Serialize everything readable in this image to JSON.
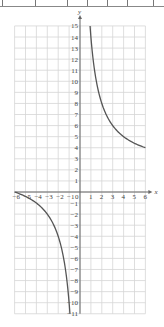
{
  "top_strip": {
    "dividers_x": [
      2,
      35,
      67,
      87,
      107,
      127,
      153
    ]
  },
  "chart_data": {
    "type": "line",
    "title": "",
    "xlabel": "x",
    "ylabel": "y",
    "xlim": [
      -6,
      6
    ],
    "ylim": [
      -11,
      15
    ],
    "grid": true,
    "x_ticks": [
      -6,
      -5,
      -4,
      -3,
      -2,
      -1,
      0,
      1,
      2,
      3,
      4,
      5,
      6
    ],
    "y_ticks": [
      15,
      14,
      13,
      12,
      11,
      10,
      9,
      8,
      7,
      6,
      5,
      4,
      3,
      2,
      1,
      -1,
      -2,
      -3,
      -4,
      -5,
      -6,
      -7,
      -8,
      -9,
      -10,
      -11
    ],
    "series": [
      {
        "name": "y = 12/x + 2 (x>0)",
        "x": [
          0.92,
          1,
          1.5,
          2,
          3,
          4,
          5,
          6
        ],
        "y": [
          15,
          14,
          10,
          8,
          6,
          5,
          4.4,
          4
        ]
      },
      {
        "name": "y = 12/x + 2 (x<0)",
        "x": [
          -6,
          -5,
          -4,
          -3,
          -2,
          -1.5,
          -1.2,
          -1,
          -0.92
        ],
        "y": [
          0,
          -0.4,
          -1,
          -2,
          -4,
          -6,
          -8,
          -10,
          -11
        ]
      }
    ],
    "color": "#555555"
  }
}
